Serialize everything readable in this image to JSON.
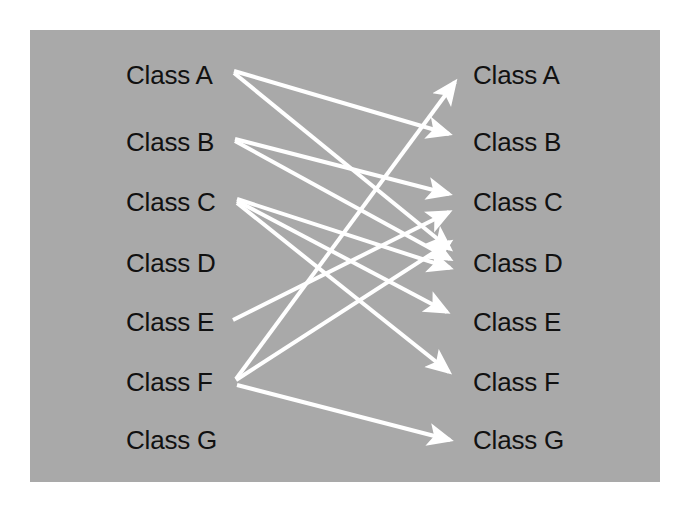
{
  "diagram": {
    "type": "bipartite-mapping",
    "title": "",
    "background_color": "#a9a9a9",
    "page_color": "#ffffff",
    "edge_color": "#ffffff",
    "label_color": "#111111",
    "panel": {
      "x": 30,
      "y": 30,
      "width": 630,
      "height": 452
    },
    "left_column": {
      "name": "source-classes",
      "x": 126,
      "nodes": [
        {
          "id": "L_A",
          "label": "Class A",
          "y": 75
        },
        {
          "id": "L_B",
          "label": "Class B",
          "y": 142
        },
        {
          "id": "L_C",
          "label": "Class C",
          "y": 202
        },
        {
          "id": "L_D",
          "label": "Class D",
          "y": 263
        },
        {
          "id": "L_E",
          "label": "Class E",
          "y": 322
        },
        {
          "id": "L_F",
          "label": "Class F",
          "y": 382
        },
        {
          "id": "L_G",
          "label": "Class G",
          "y": 440
        }
      ]
    },
    "right_column": {
      "name": "target-classes",
      "x": 473,
      "nodes": [
        {
          "id": "R_A",
          "label": "Class A",
          "y": 75
        },
        {
          "id": "R_B",
          "label": "Class B",
          "y": 142
        },
        {
          "id": "R_C",
          "label": "Class C",
          "y": 202
        },
        {
          "id": "R_D",
          "label": "Class D",
          "y": 263
        },
        {
          "id": "R_E",
          "label": "Class E",
          "y": 322
        },
        {
          "id": "R_F",
          "label": "Class F",
          "y": 382
        },
        {
          "id": "R_G",
          "label": "Class G",
          "y": 440
        }
      ]
    },
    "edges": [
      {
        "id": "e1",
        "from": "L_A",
        "to": "R_B",
        "x1": 234,
        "y1": 71,
        "x2": 449,
        "y2": 134
      },
      {
        "id": "e2",
        "from": "L_A",
        "to": "R_D",
        "x1": 234,
        "y1": 73,
        "x2": 450,
        "y2": 249
      },
      {
        "id": "e3",
        "from": "L_B",
        "to": "R_C",
        "x1": 235,
        "y1": 139,
        "x2": 449,
        "y2": 194
      },
      {
        "id": "e4",
        "from": "L_B",
        "to": "R_D",
        "x1": 235,
        "y1": 141,
        "x2": 450,
        "y2": 259
      },
      {
        "id": "e5",
        "from": "L_C",
        "to": "R_D",
        "x1": 237,
        "y1": 199,
        "x2": 450,
        "y2": 268
      },
      {
        "id": "e6",
        "from": "L_C",
        "to": "R_E",
        "x1": 237,
        "y1": 201,
        "x2": 447,
        "y2": 312
      },
      {
        "id": "e7",
        "from": "L_C",
        "to": "R_F",
        "x1": 237,
        "y1": 203,
        "x2": 449,
        "y2": 372
      },
      {
        "id": "e8",
        "from": "L_E",
        "to": "R_C",
        "x1": 233,
        "y1": 320,
        "x2": 449,
        "y2": 212
      },
      {
        "id": "e9",
        "from": "L_F",
        "to": "R_A",
        "x1": 236,
        "y1": 379,
        "x2": 455,
        "y2": 82
      },
      {
        "id": "e10",
        "from": "L_F",
        "to": "R_D",
        "x1": 236,
        "y1": 380,
        "x2": 450,
        "y2": 242
      },
      {
        "id": "e11",
        "from": "L_F",
        "to": "R_G",
        "x1": 237,
        "y1": 385,
        "x2": 450,
        "y2": 440
      }
    ],
    "edge_count": 11,
    "node_count": 14
  }
}
